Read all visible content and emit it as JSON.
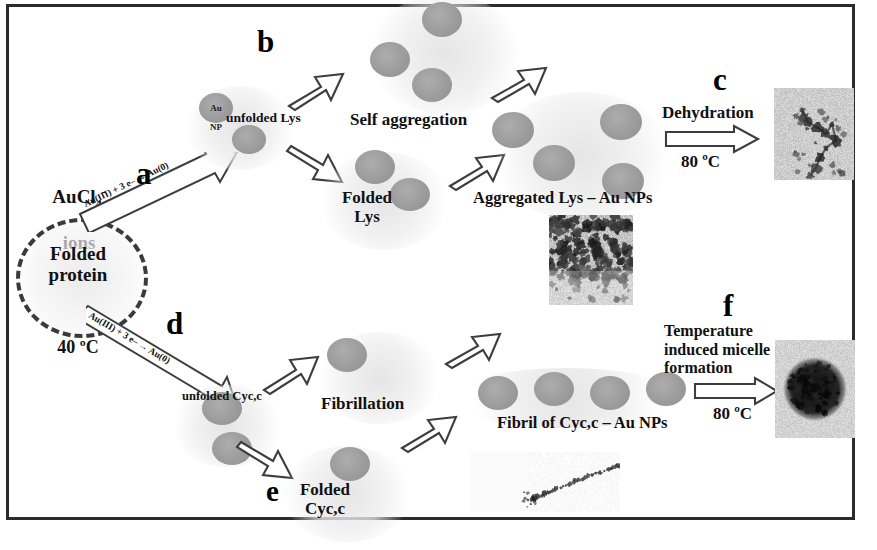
{
  "figure": {
    "background_color": "#ffffff",
    "frame_color": "#2b2b2b",
    "nanoparticle_color": "#9c9c9c"
  },
  "panels": {
    "a": "a",
    "b": "b",
    "c": "c",
    "d": "d",
    "e": "e",
    "f": "f"
  },
  "start": {
    "reagent_line1": "AuCl",
    "reagent_sub": "4",
    "reagent_sup": "-",
    "reagent_line2": "ions",
    "protein_label": "Folded\nprotein",
    "temperature": "40 ºC"
  },
  "reactions": {
    "a_equation": "Au(III) + 3 e– → Au(0)",
    "d_equation": "Au(III) + 3 e– → Au(0)"
  },
  "upper_branch": {
    "np_label_line1": "Au",
    "np_label_line2": "NP",
    "unfolded": "unfolded Lys",
    "self_aggregation": "Self aggregation",
    "folded": "Folded\nLys",
    "aggregate": "Aggregated Lys – Au NPs",
    "dehydration": "Dehydration",
    "dehydration_temp": "80 ºC"
  },
  "lower_branch": {
    "unfolded": "unfolded Cyc,c",
    "fibrillation": "Fibrillation",
    "folded": "Folded\nCyc,c",
    "fibril": "Fibril of Cyc,c – Au NPs",
    "micelle": "Temperature\ninduced micelle\nformation",
    "micelle_temp": "80 ºC"
  },
  "micrographs": {
    "aggregated_lys_tem": "TEM micrograph of aggregated Lys-Au NPs",
    "dehydrated_tem": "TEM micrograph of dehydrated Lys-Au NP network",
    "fibril_tem": "TEM micrograph of Cyc,c fibril with Au NPs",
    "micelle_tem": "TEM micrograph of spherical micelle"
  }
}
